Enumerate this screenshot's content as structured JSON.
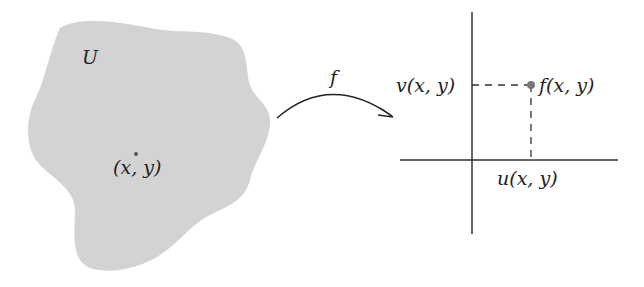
{
  "region": {
    "label": "U",
    "point_label": "(x, y)",
    "fill": "#d3d3d3"
  },
  "map": {
    "label": "f"
  },
  "plane": {
    "point_label": "f(x, y)",
    "v_label": "v(x, y)",
    "u_label": "u(x, y)",
    "point_color": "#777777"
  }
}
